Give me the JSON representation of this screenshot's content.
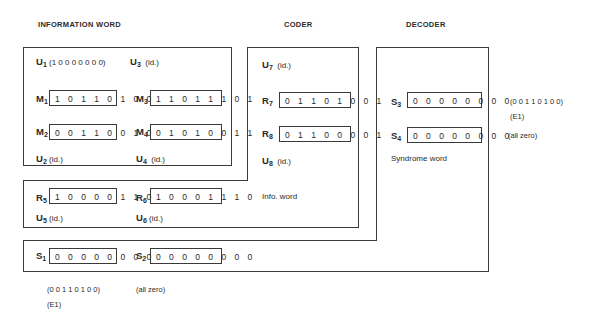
{
  "headers": {
    "information_word": "INFORMATION WORD",
    "coder": "CODER",
    "decoder": "DECODER"
  },
  "info_box": {
    "u1": {
      "sym": "U",
      "sub": "1",
      "text": "(1 0 0 0 0 0 0 0)"
    },
    "u3": {
      "sym": "U",
      "sub": "3",
      "text": "(id.)"
    },
    "m1": {
      "sym": "M",
      "sub": "1",
      "bits": "10110100"
    },
    "m3": {
      "sym": "M",
      "sub": "3",
      "bits": "11011101"
    },
    "m2": {
      "sym": "M",
      "sub": "2",
      "bits": "00110010"
    },
    "m4": {
      "sym": "M",
      "sub": "4",
      "bits": "01010011"
    },
    "u2": {
      "sym": "U",
      "sub": "2",
      "text": "(id.)"
    },
    "u4": {
      "sym": "U",
      "sub": "4",
      "text": "(id.)"
    }
  },
  "coder_box": {
    "u7": {
      "sym": "U",
      "sub": "7",
      "text": "(id.)"
    },
    "r7": {
      "sym": "R",
      "sub": "7",
      "bits": "01101001"
    },
    "r8": {
      "sym": "R",
      "sub": "8",
      "bits": "01100001"
    },
    "u8": {
      "sym": "U",
      "sub": "8",
      "text": "(id.)"
    },
    "caption": "Info. word",
    "r5": {
      "sym": "R",
      "sub": "5",
      "bits": "10000110"
    },
    "r6": {
      "sym": "R",
      "sub": "6",
      "bits": "10001110"
    },
    "u5": {
      "sym": "U",
      "sub": "5",
      "text": "(id.)"
    },
    "u6": {
      "sym": "U",
      "sub": "6",
      "text": "(id.)"
    }
  },
  "decoder_box": {
    "s3": {
      "sym": "S",
      "sub": "3",
      "bits": "00000000"
    },
    "s4": {
      "sym": "S",
      "sub": "4",
      "bits": "00000000"
    },
    "caption": "Syndrome word",
    "s1": {
      "sym": "S",
      "sub": "1",
      "bits": "00000000"
    },
    "s2": {
      "sym": "S",
      "sub": "2",
      "bits": "00000000"
    }
  },
  "notes": {
    "right_error": "(0 0 1 1 0 1 0 0)",
    "right_e1": "(E1)",
    "right_zero": "(all zero)",
    "bottom_error": "(0 0 1 1 0 1 0 0)",
    "bottom_e1": "(E1)",
    "bottom_zero": "(all zero)"
  }
}
